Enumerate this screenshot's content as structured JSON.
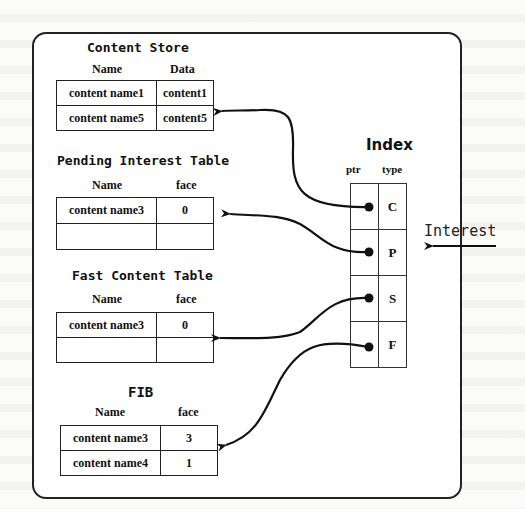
{
  "content_store": {
    "title": "Content Store",
    "headers": [
      "Name",
      "Data"
    ],
    "rows": [
      [
        "content name1",
        "content1"
      ],
      [
        "content name5",
        "content5"
      ]
    ]
  },
  "pit": {
    "title": "Pending Interest Table",
    "headers": [
      "Name",
      "face"
    ],
    "rows": [
      [
        "content name3",
        "0"
      ],
      [
        "",
        ""
      ]
    ]
  },
  "fct": {
    "title": "Fast Content Table",
    "headers": [
      "Name",
      "face"
    ],
    "rows": [
      [
        "content name3",
        "0"
      ],
      [
        "",
        ""
      ]
    ]
  },
  "fib": {
    "title": "FIB",
    "headers": [
      "Name",
      "face"
    ],
    "rows": [
      [
        "content name3",
        "3"
      ],
      [
        "content name4",
        "1"
      ]
    ]
  },
  "index": {
    "title": "Index",
    "headers": [
      "ptr",
      "type"
    ],
    "rows": [
      {
        "ptr": "",
        "type": "C"
      },
      {
        "ptr": "",
        "type": "P"
      },
      {
        "ptr": "",
        "type": "S"
      },
      {
        "ptr": "",
        "type": "F"
      }
    ]
  },
  "interest_label": "Interest",
  "links": [
    {
      "from": "index-C",
      "to": "content-store"
    },
    {
      "from": "index-P",
      "to": "pending-interest-table"
    },
    {
      "from": "index-S",
      "to": "fast-content-table"
    },
    {
      "from": "index-F",
      "to": "fib"
    }
  ]
}
